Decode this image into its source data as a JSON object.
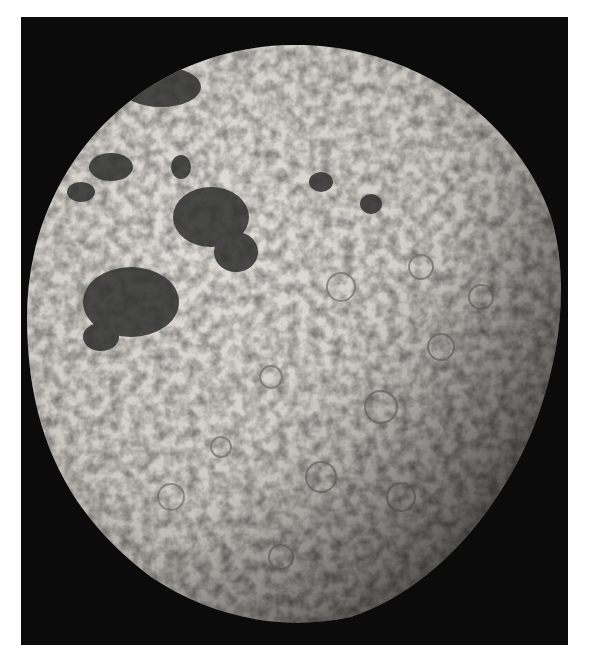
{
  "image": {
    "subject": "Moon (far side, gibbous)",
    "colors": {
      "background": "#ffffff",
      "space": "#0b0b0b",
      "surface_light": "#d9d6d0",
      "surface_mid": "#a8a5a0",
      "mare_dark": "#2e2e2e",
      "terminator_shadow": "#3a3a3a"
    }
  }
}
